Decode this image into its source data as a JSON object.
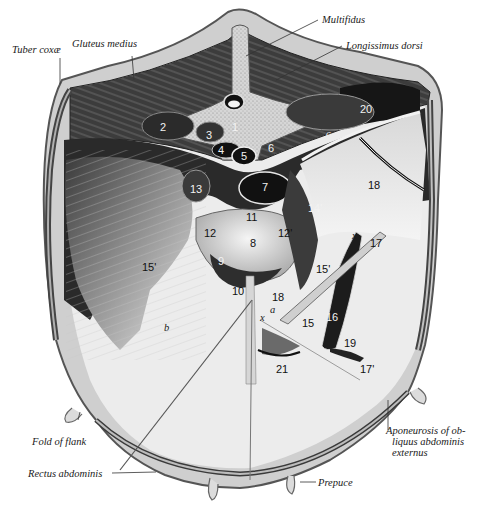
{
  "figure": {
    "outer_labels": {
      "tuber_coxae": "Tuber coxæ",
      "gluteus_medius": "Gluteus medius",
      "multifidus": "Multifidus",
      "longissimus_dorsi": "Longissimus dorsi",
      "fold_of_flank": "Fold of flank",
      "rectus_abdominis": "Rectus abdominis",
      "prepuce": "Prepuce",
      "aponeurosis_line1": "Aponeurosis of ob-",
      "aponeurosis_line2": "liquus abdominis",
      "aponeurosis_line3": "externus"
    },
    "numbers": {
      "n1": "1",
      "n2": "2",
      "n3": "3",
      "n4": "4",
      "n5": "5",
      "n6": "6",
      "n7": "7",
      "n8": "8",
      "n9": "9",
      "n10": "10",
      "n11": "11",
      "n12a": "12",
      "n12b": "12'",
      "n13": "13",
      "n14": "14'",
      "n15": "15",
      "n15a": "15'",
      "n15b": "15'",
      "n16": "16",
      "n17": "17",
      "n17b": "17'",
      "n18a": "18",
      "n18b": "18",
      "n19": "19",
      "n20": "20",
      "n21": "21"
    },
    "letters": {
      "a": "a",
      "b": "b",
      "c": "c",
      "x1": "x",
      "x2": "x"
    }
  }
}
